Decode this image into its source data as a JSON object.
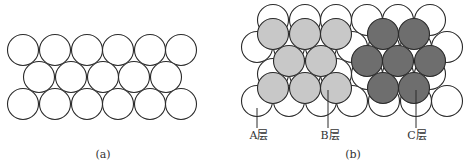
{
  "colors": {
    "outline": "#2a2a2a",
    "layer_a": "#ffffff",
    "layer_b": "#c8c8c8",
    "layer_c": "#6e6e6e",
    "background": "#ffffff"
  },
  "panel_a": {
    "caption": "(a)",
    "radius": 15.5,
    "circles": [
      [
        23,
        50
      ],
      [
        55,
        50
      ],
      [
        87,
        50
      ],
      [
        118,
        50
      ],
      [
        150,
        50
      ],
      [
        181,
        50
      ],
      [
        39,
        77
      ],
      [
        71,
        77
      ],
      [
        103,
        77
      ],
      [
        134,
        77
      ],
      [
        166,
        77
      ],
      [
        23,
        104
      ],
      [
        55,
        104
      ],
      [
        87,
        104
      ],
      [
        118,
        104
      ],
      [
        150,
        104
      ],
      [
        181,
        104
      ]
    ]
  },
  "panel_b": {
    "caption": "(b)",
    "radius": 15.5,
    "layer_a_circles": [
      [
        273,
        20
      ],
      [
        305,
        20
      ],
      [
        336,
        20
      ],
      [
        367,
        20
      ],
      [
        398,
        20
      ],
      [
        430,
        20
      ],
      [
        257,
        47
      ],
      [
        289,
        47
      ],
      [
        321,
        47
      ],
      [
        352,
        47
      ],
      [
        384,
        47
      ],
      [
        416,
        47
      ],
      [
        447,
        47
      ],
      [
        273,
        74
      ],
      [
        305,
        74
      ],
      [
        336,
        74
      ],
      [
        367,
        74
      ],
      [
        398,
        74
      ],
      [
        430,
        74
      ],
      [
        257,
        101
      ],
      [
        289,
        101
      ],
      [
        321,
        101
      ],
      [
        352,
        101
      ],
      [
        384,
        101
      ],
      [
        416,
        101
      ],
      [
        447,
        101
      ]
    ],
    "layer_b_circles": [
      [
        273,
        34
      ],
      [
        305,
        34
      ],
      [
        336,
        34
      ],
      [
        289,
        61
      ],
      [
        321,
        61
      ],
      [
        273,
        88
      ],
      [
        305,
        88
      ],
      [
        336,
        88
      ]
    ],
    "layer_c_circles": [
      [
        383,
        34
      ],
      [
        414,
        34
      ],
      [
        367,
        61
      ],
      [
        398,
        61
      ],
      [
        430,
        61
      ],
      [
        383,
        88
      ],
      [
        414,
        88
      ]
    ],
    "labels": [
      {
        "text": "A层",
        "x": 259,
        "y": 130,
        "line": [
          257,
          108,
          257,
          128
        ]
      },
      {
        "text": "B层",
        "x": 330,
        "y": 130,
        "line": [
          328,
          90,
          328,
          128
        ]
      },
      {
        "text": "C层",
        "x": 417,
        "y": 130,
        "line": [
          416,
          90,
          416,
          128
        ]
      }
    ]
  }
}
